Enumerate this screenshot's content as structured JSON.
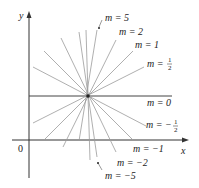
{
  "figure": {
    "type": "diagram",
    "axes": {
      "x_label": "x",
      "y_label": "y",
      "origin_label": "0"
    },
    "center": {
      "x": 88,
      "y": 96
    },
    "colors": {
      "lines": "#9a9a9a",
      "axes": "#333333",
      "text": "#222222"
    },
    "labels": {
      "m5": "m = 5",
      "m2": "m = 2",
      "m1": "m = 1",
      "mhalf_prefix": "m = ",
      "mhalf_num": "1",
      "mhalf_den": "2",
      "m0": "m = 0",
      "mneghalf_prefix": "m = −",
      "mneghalf_num": "1",
      "mneghalf_den": "2",
      "mneg1": "m = −1",
      "mneg2": "m = −2",
      "mneg5": "m = −5"
    },
    "slopes": [
      5,
      2,
      1,
      0.5,
      0,
      -0.5,
      -1,
      -2,
      -5
    ]
  }
}
